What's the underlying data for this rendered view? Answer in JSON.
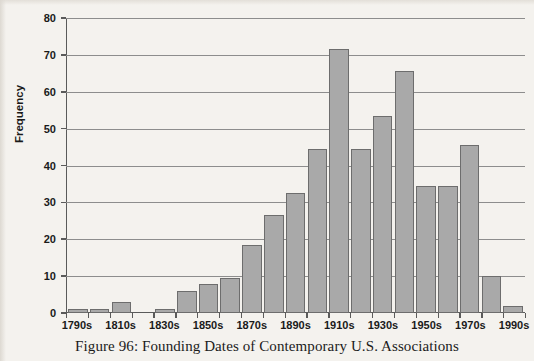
{
  "caption": "Figure 96: Founding Dates of Contemporary U.S. Associations",
  "colors": {
    "bar_fill": "#a9a9a9",
    "bar_border": "#6d6d6d",
    "axis": "#5a5a5a",
    "gridline": "#8d8d8d",
    "background": "#f4f2ee",
    "text": "#1a1a1a"
  },
  "chart_data": {
    "type": "bar",
    "title": "Figure 96: Founding Dates of Contemporary U.S. Associations",
    "xlabel": "",
    "ylabel": "Frequency",
    "ylim": [
      0,
      80
    ],
    "yticks": [
      0,
      10,
      20,
      30,
      40,
      50,
      60,
      70,
      80
    ],
    "ytick_labels": [
      "0",
      "10",
      "20",
      "30",
      "40",
      "50",
      "60",
      "70",
      "80"
    ],
    "grid": "horizontal",
    "legend": "none",
    "categories": [
      "1790s",
      "1800s",
      "1810s",
      "1820s",
      "1830s",
      "1840s",
      "1850s",
      "1860s",
      "1870s",
      "1880s",
      "1890s",
      "1900s",
      "1910s",
      "1920s",
      "1930s",
      "1940s",
      "1950s",
      "1960s",
      "1970s",
      "1980s",
      "1990s"
    ],
    "xtick_labels_shown": [
      "1790s",
      "1810s",
      "1830s",
      "1850s",
      "1870s",
      "1890s",
      "1910s",
      "1930s",
      "1950s",
      "1970s",
      "1990s"
    ],
    "values": [
      1,
      1,
      3,
      0,
      1,
      6,
      8,
      9.5,
      18.5,
      26.5,
      32.5,
      44.5,
      71.5,
      44.5,
      53.5,
      65.5,
      34.5,
      34.5,
      45.5,
      10,
      2
    ]
  }
}
